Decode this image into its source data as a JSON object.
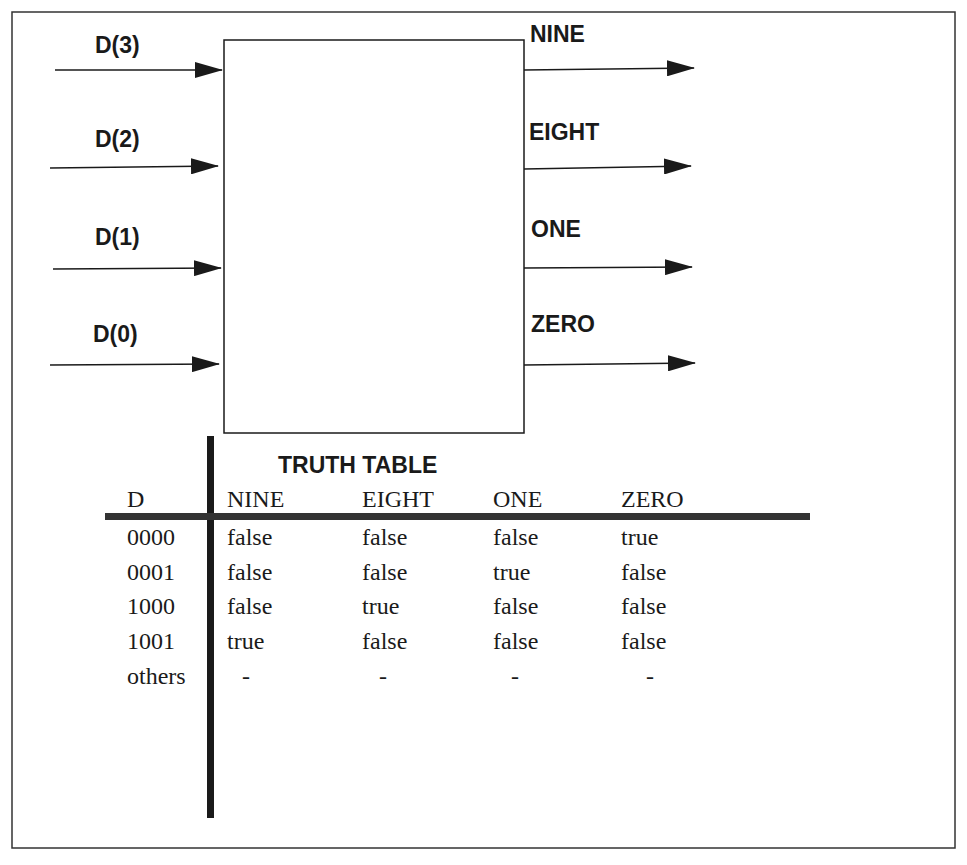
{
  "diagram": {
    "inputs": [
      "D(3)",
      "D(2)",
      "D(1)",
      "D(0)"
    ],
    "outputs": [
      "NINE",
      "EIGHT",
      "ONE",
      "ZERO"
    ]
  },
  "truth_table": {
    "title": "TRUTH TABLE",
    "headers": [
      "D",
      "NINE",
      "EIGHT",
      "ONE",
      "ZERO"
    ],
    "rows": [
      [
        "0000",
        "false",
        "false",
        "false",
        "true"
      ],
      [
        "0001",
        "false",
        "false",
        "true",
        "false"
      ],
      [
        "1000",
        "false",
        "true",
        "false",
        "false"
      ],
      [
        "1001",
        "true",
        "false",
        "false",
        "false"
      ],
      [
        "others",
        "-",
        "-",
        "-",
        "-"
      ]
    ]
  },
  "colors": {
    "ink": "#1a1a1a",
    "background": "#ffffff"
  }
}
